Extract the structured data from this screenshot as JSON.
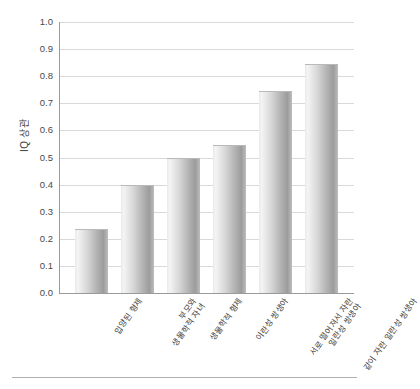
{
  "chart_data": {
    "type": "bar",
    "title": "",
    "subtitle": "",
    "xlabel": "",
    "ylabel": "IQ 상관",
    "ylim": [
      0.0,
      1.0
    ],
    "ytick_labels": [
      "1.0",
      "0.9",
      "0.8",
      "0.7",
      "0.6",
      "0.5",
      "0.4",
      "0.3",
      "0.2",
      "0.1",
      "0.0"
    ],
    "ytick_values": [
      1.0,
      0.9,
      0.8,
      0.7,
      0.6,
      0.5,
      0.4,
      0.3,
      0.2,
      0.1,
      0.0
    ],
    "grid": true,
    "grid_axis": "y",
    "legend": false,
    "legend_position": "none",
    "categories": [
      "입양된 형제",
      "부모와\n생물학적 자녀",
      "생물학적 형제",
      "이란성 쌍생아",
      "서로 떨어져서 자란\n일란성 쌍생아",
      "같이 자란 일란성 쌍생아"
    ],
    "values": [
      0.235,
      0.4,
      0.5,
      0.545,
      0.745,
      0.845
    ],
    "bar_color": "#bdbdbd",
    "bar_edge_color": "#b9b9b9",
    "grid_color": "#d9d9d9",
    "axis_color": "#9a9a9a",
    "text_color": "#3d3d3d"
  }
}
